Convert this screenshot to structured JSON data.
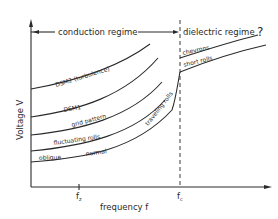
{
  "diagram": {
    "regimes": {
      "conduction": "conduction regime",
      "dielectric": "dielectric regime",
      "question_mark": "?"
    },
    "axes": {
      "y_label": "Voltage V",
      "x_label": "frequency f",
      "x_ticks": {
        "fz": "f",
        "fz_sub": "z",
        "fc": "f",
        "fc_sub": "c"
      }
    },
    "curve_labels": {
      "dsm2": "DSM2 (turbulence)",
      "dsm1": "DSM1",
      "grid": "grid pattern",
      "fluctuating": "fluctuating rolls",
      "oblique": "oblique",
      "normal": "normal",
      "traveling": "traveling rolls",
      "chevrons": "chevrons",
      "short_rolls": "short rolls"
    }
  }
}
